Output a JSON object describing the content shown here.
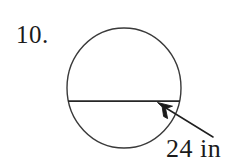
{
  "page": {
    "background_color": "#ffffff",
    "ink_color": "#262626",
    "width": 245,
    "height": 163
  },
  "problem": {
    "number_label": "10.",
    "measurement_label": "24 in"
  },
  "figure": {
    "type": "circle-with-chord",
    "circle": {
      "center_x": 124,
      "center_y": 88,
      "radius_x": 57,
      "radius_y": 60,
      "stroke_color": "#3a3a3a",
      "stroke_width": 1.4,
      "fill": "none"
    },
    "chord": {
      "x1": 68,
      "y1": 101,
      "x2": 180,
      "y2": 101,
      "stroke_color": "#262626",
      "stroke_width": 1.6,
      "measure": "24 in"
    },
    "leader_arrow": {
      "tail_x": 213,
      "tail_y": 137,
      "tip_x": 158,
      "tip_y": 103,
      "stroke_color": "#1f1f1f",
      "stroke_width": 1.5,
      "head_style": "filled-barb"
    }
  }
}
